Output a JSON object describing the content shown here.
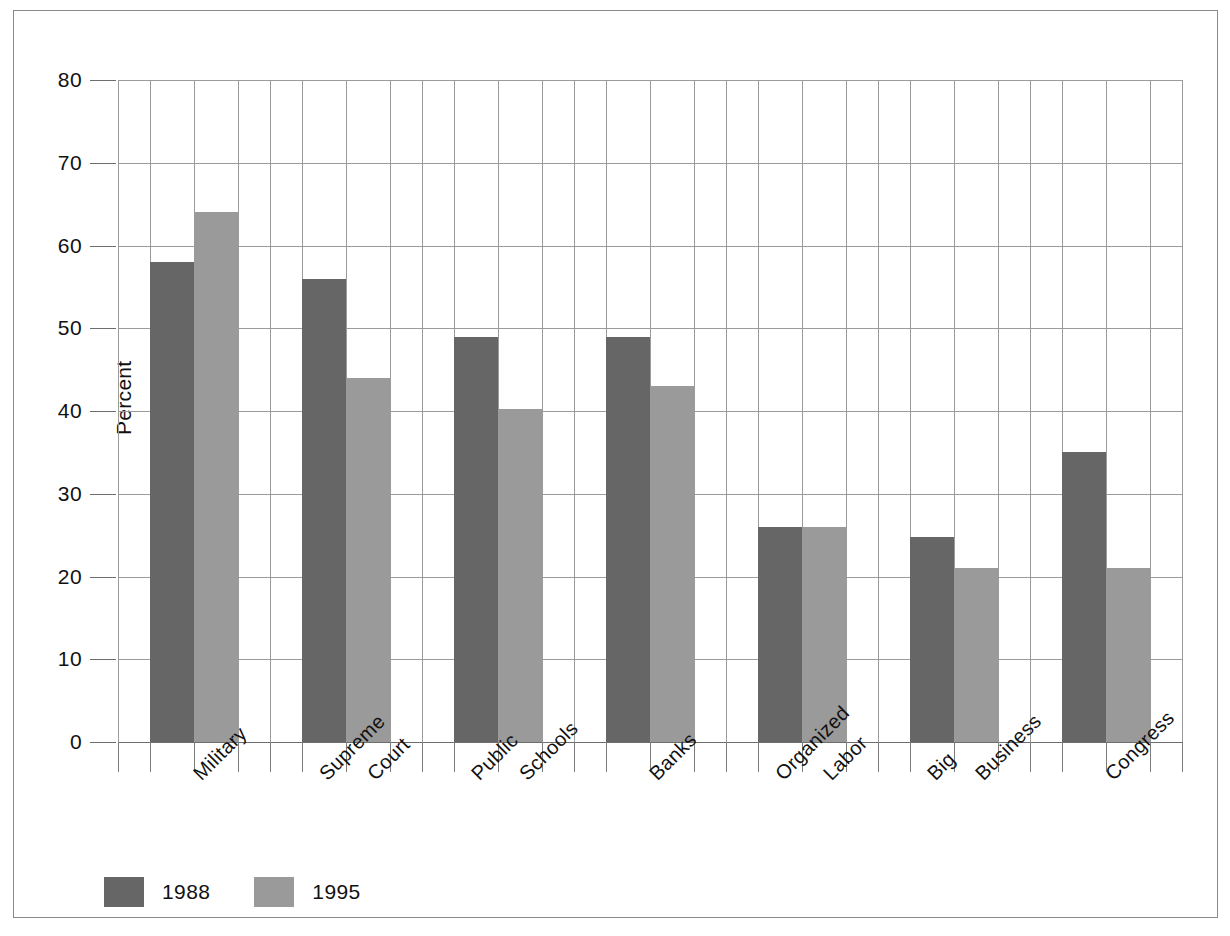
{
  "chart_data": {
    "type": "bar",
    "title": "",
    "xlabel": "",
    "ylabel": "Percent",
    "ylim": [
      0,
      80
    ],
    "ytick_step": 10,
    "yticks": [
      0,
      10,
      20,
      30,
      40,
      50,
      60,
      70,
      80
    ],
    "ytick_labels": [
      "0",
      "10",
      "20",
      "30",
      "40",
      "50",
      "60",
      "70",
      "80"
    ],
    "grid": "horizontal-and-vertical",
    "legend_position": "below-axes-left",
    "categories": [
      "Military",
      "Supreme Court",
      "Public Schools",
      "Banks",
      "Organized Labor",
      "Big Business",
      "Congress"
    ],
    "category_lines": [
      [
        "Military"
      ],
      [
        "Supreme",
        "Court"
      ],
      [
        "Public",
        "Schools"
      ],
      [
        "Banks"
      ],
      [
        "Organized",
        "Labor"
      ],
      [
        "Big",
        "Business"
      ],
      [
        "Congress"
      ]
    ],
    "series": [
      {
        "name": "1988",
        "color": "#666666",
        "values": [
          58,
          56,
          49,
          49,
          26,
          24.8,
          35
        ]
      },
      {
        "name": "1995",
        "color": "#9a9a9a",
        "values": [
          64,
          44,
          40.2,
          43,
          26,
          21,
          21
        ]
      }
    ]
  },
  "legend": {
    "items": [
      {
        "label": "1988",
        "color": "#666666"
      },
      {
        "label": "1995",
        "color": "#9a9a9a"
      }
    ]
  },
  "axes": {
    "y_title": "Percent"
  }
}
